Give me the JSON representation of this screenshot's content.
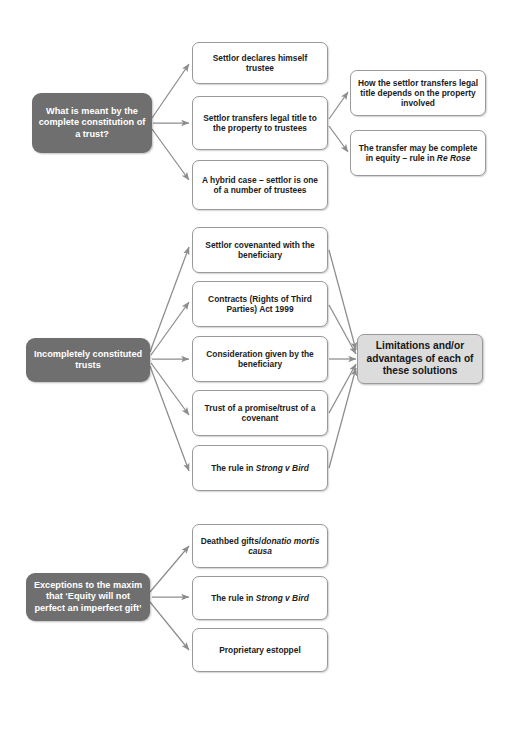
{
  "diagram": {
    "background_color": "#ffffff",
    "root_node_color": "#706f6f",
    "root_text_color": "#ffffff",
    "leaf_box_color": "#ffffff",
    "leaf_border_color": "#9a9a9a",
    "summary_box_color": "#dcdcdc",
    "connector_color": "#8c8c8c"
  },
  "sections": {
    "section1": {
      "root": "What is meant by the complete constitution of a trust?",
      "branch1": "Settlor declares himself trustee",
      "branch2": "Settlor transfers legal title to the property to trustees",
      "branch3": "A hybrid case – settlor is one of a number of trustees",
      "sub1": "How the settlor transfers legal title depends on the property involved",
      "sub2_prefix": "The transfer may be complete in equity – rule in ",
      "sub2_case": "Re Rose"
    },
    "section2": {
      "root": "Incompletely constituted trusts",
      "branch1": "Settlor covenanted with the beneficiary",
      "branch2": "Contracts (Rights of Third Parties) Act 1999",
      "branch3": "Consideration given by the beneficiary",
      "branch4": "Trust of a promise/trust of a covenant",
      "branch5_prefix": "The rule in ",
      "branch5_case": "Strong v Bird",
      "summary": "Limitations and/or advantages of each of these solutions"
    },
    "section3": {
      "root": "Exceptions to the maxim that ‘Equity will not perfect an imperfect gift’",
      "branch1_prefix": "Deathbed gifts/",
      "branch1_case": "donatio mortis causa",
      "branch2_prefix": "The rule in ",
      "branch2_case": "Strong v Bird",
      "branch3": "Proprietary estoppel"
    }
  }
}
